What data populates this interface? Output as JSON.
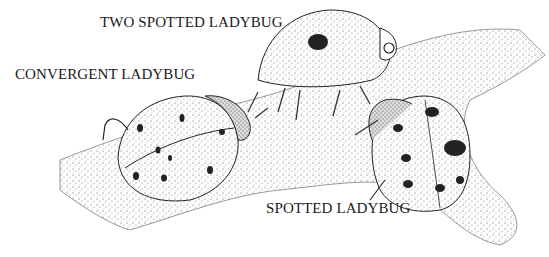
{
  "labels": {
    "two_spotted": "TWO SPOTTED LADYBUG",
    "convergent": "CONVERGENT LADYBUG",
    "spotted": "SPOTTED LADYBUG"
  },
  "colors": {
    "ink": "#1a1a1a",
    "background": "#ffffff",
    "stipple": "#9a9a9a"
  }
}
